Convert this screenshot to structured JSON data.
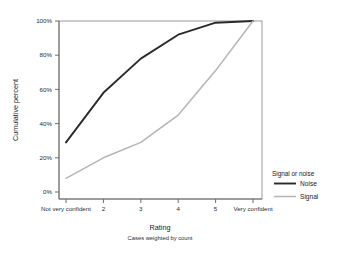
{
  "chart_data": {
    "type": "line",
    "title": "",
    "xlabel": "Rating",
    "xsublabel": "Cases weighted by count",
    "ylabel": "Cumulative percent",
    "categories": [
      "Not very confident",
      "2",
      "3",
      "4",
      "5",
      "Very confident"
    ],
    "ylim": [
      0,
      100
    ],
    "ytick_labels": [
      "0%",
      "20%",
      "40%",
      "60%",
      "80%",
      "100%"
    ],
    "ytick_values": [
      0,
      20,
      40,
      60,
      80,
      100
    ],
    "grid": false,
    "legend_position": "right",
    "legend_title": "Signal or noise",
    "series": [
      {
        "name": "Noise",
        "color": "#2a2a2a",
        "width": 1.9,
        "values": [
          29,
          58,
          78,
          92,
          99,
          100
        ]
      },
      {
        "name": "Signal",
        "color": "#b5b5b5",
        "width": 1.5,
        "values": [
          8,
          20,
          29,
          45,
          71,
          100
        ]
      }
    ]
  },
  "axes": {
    "frame_color": "#9a9a9a",
    "tick_color": "#6d6d6d"
  }
}
